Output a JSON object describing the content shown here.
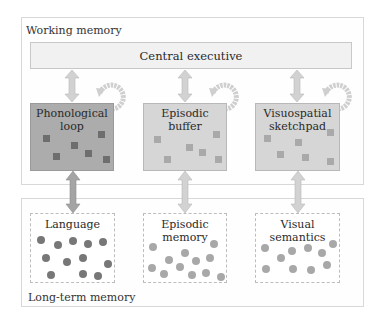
{
  "working_memory": {
    "label": "Working memory",
    "central_executive": "Central executive",
    "components": [
      {
        "line1": "Phonological",
        "line2": "loop",
        "shade": "dark",
        "fill": "#acacac",
        "square_color": "#6e6e6e"
      },
      {
        "line1": "Episodic",
        "line2": "buffer",
        "shade": "light",
        "fill": "#d6d6d6",
        "square_color": "#a9a9a9"
      },
      {
        "line1": "Visuospatial",
        "line2": "sketchpad",
        "shade": "light",
        "fill": "#d6d6d6",
        "square_color": "#a9a9a9"
      }
    ]
  },
  "long_term_memory": {
    "label": "Long-term memory",
    "stores": [
      {
        "line1": "Language",
        "line2": "",
        "dot_color": "#777777"
      },
      {
        "line1": "Episodic",
        "line2": "memory",
        "dot_color": "#a8a8a8"
      },
      {
        "line1": "Visual",
        "line2": "semantics",
        "dot_color": "#a8a8a8"
      }
    ]
  },
  "colors": {
    "dark_arrow": "#a4a4a4",
    "light_arrow": "#d2d2d2",
    "loop_arrow": "#cfcfcf"
  }
}
